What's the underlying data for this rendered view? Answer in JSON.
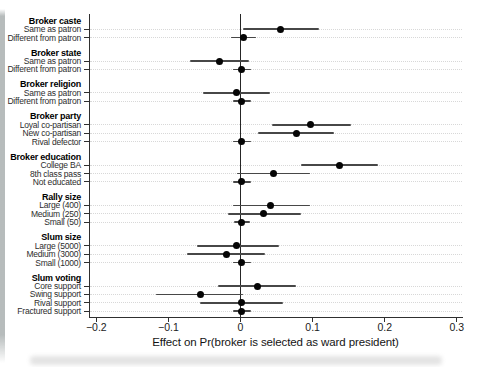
{
  "chart_data": {
    "type": "scatter",
    "subtype": "horizontal coefficient (forest) plot with 95% confidence intervals",
    "title": "",
    "xlabel": "Effect on Pr(broker is selected as ward president)",
    "ylabel": "",
    "xlim": [
      -0.21,
      0.31
    ],
    "x_ticks": [
      {
        "value": -0.2,
        "label": "−0.2"
      },
      {
        "value": -0.1,
        "label": "−0.1"
      },
      {
        "value": 0,
        "label": "0"
      },
      {
        "value": 0.1,
        "label": "0.1"
      },
      {
        "value": 0.2,
        "label": "0.2"
      },
      {
        "value": 0.3,
        "label": "0.3"
      }
    ],
    "zero_reference_line": 0,
    "grid": "dotted horizontal gridline per item row",
    "legend": "none",
    "groups": [
      {
        "label": "Broker caste",
        "items": [
          {
            "label": "Same as patron",
            "est": 0.056,
            "lo": 0.003,
            "hi": 0.109
          },
          {
            "label": "Different from patron",
            "est": 0.004,
            "lo": -0.013,
            "hi": 0.022
          }
        ]
      },
      {
        "label": "Broker state",
        "items": [
          {
            "label": "Same as patron",
            "est": -0.029,
            "lo": -0.07,
            "hi": 0.012
          },
          {
            "label": "Different from patron",
            "est": 0.002,
            "lo": -0.01,
            "hi": 0.014
          }
        ]
      },
      {
        "label": "Broker religion",
        "items": [
          {
            "label": "Same as patron",
            "est": -0.005,
            "lo": -0.052,
            "hi": 0.041
          },
          {
            "label": "Different from patron",
            "est": 0.002,
            "lo": -0.01,
            "hi": 0.014
          }
        ]
      },
      {
        "label": "Broker party",
        "items": [
          {
            "label": "Loyal co-partisan",
            "est": 0.097,
            "lo": 0.044,
            "hi": 0.153
          },
          {
            "label": "New co-partisan",
            "est": 0.077,
            "lo": 0.024,
            "hi": 0.13
          },
          {
            "label": "Rival defector",
            "est": 0.002,
            "lo": -0.011,
            "hi": 0.015
          }
        ]
      },
      {
        "label": "Broker education",
        "items": [
          {
            "label": "College BA",
            "est": 0.137,
            "lo": 0.084,
            "hi": 0.191
          },
          {
            "label": "8th class pass",
            "est": 0.046,
            "lo": -0.005,
            "hi": 0.097
          },
          {
            "label": "Not educated",
            "est": 0.002,
            "lo": -0.01,
            "hi": 0.014
          }
        ]
      },
      {
        "label": "Rally size",
        "items": [
          {
            "label": "Large (400)",
            "est": 0.042,
            "lo": -0.01,
            "hi": 0.096
          },
          {
            "label": "Medium (250)",
            "est": 0.032,
            "lo": -0.018,
            "hi": 0.084
          },
          {
            "label": "Small (50)",
            "est": 0.002,
            "lo": -0.009,
            "hi": 0.013
          }
        ]
      },
      {
        "label": "Slum size",
        "items": [
          {
            "label": "Large (5000)",
            "est": -0.006,
            "lo": -0.06,
            "hi": 0.053
          },
          {
            "label": "Medium (3000)",
            "est": -0.019,
            "lo": -0.074,
            "hi": 0.034
          },
          {
            "label": "Small (1000)",
            "est": 0.002,
            "lo": -0.01,
            "hi": 0.014
          }
        ]
      },
      {
        "label": "Slum voting",
        "items": [
          {
            "label": "Core support",
            "est": 0.023,
            "lo": -0.031,
            "hi": 0.077
          },
          {
            "label": "Swing support",
            "est": -0.056,
            "lo": -0.117,
            "hi": 0.004
          },
          {
            "label": "Rival support",
            "est": 0.001,
            "lo": -0.056,
            "hi": 0.059
          },
          {
            "label": "Fractured support",
            "est": 0.002,
            "lo": -0.01,
            "hi": 0.014
          }
        ]
      }
    ]
  },
  "colors": {
    "background": "#ffffff",
    "point": "#050505",
    "ci_line": "#474747",
    "axis": "#2f2f2f",
    "zero_line": "#262626",
    "gridline": "#d8d8d8",
    "label_text": "#2d2d2d",
    "header_text": "#000000"
  }
}
